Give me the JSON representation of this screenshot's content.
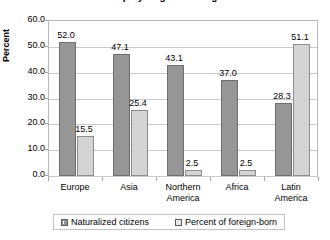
{
  "chart_data": {
    "type": "bar",
    "title": "Citizenship by Region of Origin: 2008",
    "xlabel": "",
    "ylabel": "Percent",
    "ylim": [
      0,
      60
    ],
    "ytick_step": 10,
    "ytick_labels": [
      "60.0",
      "50.0",
      "40.0",
      "30.0",
      "20.0",
      "10.0",
      "0.0"
    ],
    "grid": true,
    "legend_position": "bottom",
    "categories": [
      "Europe",
      "Asia",
      "Northern America",
      "Africa",
      "Latin America"
    ],
    "category_lines": [
      [
        "Europe"
      ],
      [
        "Asia"
      ],
      [
        "Northern",
        "America"
      ],
      [
        "Africa"
      ],
      [
        "Latin",
        "America"
      ]
    ],
    "series": [
      {
        "name": "Naturalized citizens",
        "color": "#969696",
        "values": [
          52.0,
          47.1,
          43.1,
          37.0,
          28.3
        ],
        "labels": [
          "52.0",
          "47.1",
          "43.1",
          "37.0",
          "28.3"
        ]
      },
      {
        "name": "Percent of foreign-born",
        "color": "#d4d4d4",
        "values": [
          15.5,
          25.4,
          2.5,
          2.5,
          51.1
        ],
        "labels": [
          "15.5",
          "25.4",
          "2.5",
          "2.5",
          "51.1"
        ]
      }
    ]
  }
}
